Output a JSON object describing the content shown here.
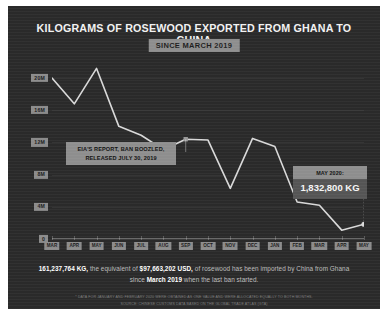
{
  "card": {
    "background_color": "#2a2a2a",
    "accent_color": "#8e8e8e",
    "line_color": "#d9d9d9"
  },
  "header": {
    "title": "KILOGRAMS OF ROSEWOOD EXPORTED FROM GHANA TO CHINA",
    "subtitle_badge": "SINCE MARCH 2019"
  },
  "annotations": {
    "eia": {
      "line1": "EIA'S REPORT, BAN BOOZLED,",
      "line2": "RELEASED JULY 30, 2019"
    },
    "may": {
      "label": "MAY 2020:",
      "value": "1,832,800 KG"
    }
  },
  "summary": {
    "kg": "161,237,764 KG,",
    "text_1": " the equivalent of ",
    "usd": "$97,663,202 USD,",
    "text_2": " of rosewood has been imported by China from Ghana since ",
    "date": "March 2019",
    "text_3": " when the last ban started."
  },
  "footnote": {
    "line1": "* DATA FOR JANUARY AND FEBRUARY 2020 WERE OBTAINED AS ONE VALUE AND WERE ALLOCATED EQUALLY TO BOTH MONTHS.",
    "line2": "SOURCE: CHINESE CUSTOMS DATA BASED ON THE GLOBAL TRADE ATLAS (GTA)"
  },
  "chart_data": {
    "type": "line",
    "title": "KILOGRAMS OF ROSEWOOD EXPORTED FROM GHANA TO CHINA",
    "subtitle": "SINCE MARCH 2019",
    "xlabel": "",
    "ylabel": "",
    "ylim": [
      0,
      22000000
    ],
    "yticks": [
      0,
      4000000,
      8000000,
      12000000,
      16000000,
      20000000
    ],
    "ytick_labels": [
      "0",
      "4M",
      "8M",
      "12M",
      "16M",
      "20M"
    ],
    "grid": true,
    "legend": "none",
    "categories": [
      "MAR",
      "APR",
      "MAY",
      "JUN",
      "JUL",
      "AUG",
      "SEP",
      "OCT",
      "NOV",
      "DEC",
      "JAN",
      "FEB",
      "MAR",
      "APR",
      "MAY"
    ],
    "x": [
      "Mar 2019",
      "Apr 2019",
      "May 2019",
      "Jun 2019",
      "Jul 2019",
      "Aug 2019",
      "Sep 2019",
      "Oct 2019",
      "Nov 2019",
      "Dec 2019",
      "Jan 2020",
      "Feb 2020",
      "Mar 2020",
      "Apr 2020",
      "May 2020"
    ],
    "values": [
      20000000,
      16800000,
      21200000,
      14000000,
      12900000,
      11100000,
      12400000,
      12300000,
      6300000,
      12500000,
      11500000,
      4600000,
      4200000,
      1100000,
      1832800
    ],
    "end_point_label": "1,832,800 KG",
    "annotations": [
      {
        "text": "EIA'S REPORT, BAN BOOZLED, RELEASED JULY 30, 2019",
        "at": "Sep 2019"
      },
      {
        "text": "MAY 2020: 1,832,800 KG",
        "at": "May 2020"
      }
    ]
  }
}
